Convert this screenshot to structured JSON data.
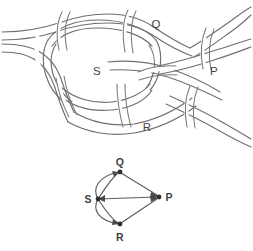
{
  "figure": {
    "background_color": "#ffffff",
    "stroke_color": "#6f6f72",
    "label_color": "#3f3f43",
    "node_color": "#2f2f33",
    "width": 253,
    "height": 251
  },
  "knot_diagram": {
    "name": "link-diagram",
    "description": "Hand drawn link diagram with four shaded regions labelled S, Q, P and R separated by crossing strands",
    "region_labels": [
      {
        "text": "S",
        "x": 97,
        "y": 71
      },
      {
        "text": "Q",
        "x": 156,
        "y": 24
      },
      {
        "text": "P",
        "x": 214,
        "y": 71
      },
      {
        "text": "R",
        "x": 147,
        "y": 127
      }
    ],
    "crossing_count": 6
  },
  "graph_diagram": {
    "name": "region-graph",
    "description": "Planar graph whose vertices are the labelled regions of the link diagram",
    "vertices": [
      {
        "id": "Q",
        "label": "Q",
        "x": 120,
        "y": 172,
        "label_x": 120,
        "label_y": 164
      },
      {
        "id": "S",
        "label": "S",
        "x": 98,
        "y": 199,
        "label_x": 88,
        "label_y": 202
      },
      {
        "id": "P",
        "label": "P",
        "x": 159,
        "y": 197,
        "label_x": 168,
        "label_y": 200
      },
      {
        "id": "R",
        "label": "R",
        "x": 120,
        "y": 224,
        "label_x": 120,
        "label_y": 240
      }
    ],
    "edges": [
      {
        "from": "S",
        "to": "Q",
        "style": "curve-left",
        "multiplicity": 1
      },
      {
        "from": "S",
        "to": "Q",
        "style": "curve-right",
        "multiplicity": 2
      },
      {
        "from": "S",
        "to": "R",
        "style": "curve-left",
        "multiplicity": 1
      },
      {
        "from": "S",
        "to": "R",
        "style": "curve-right",
        "multiplicity": 2
      },
      {
        "from": "S",
        "to": "P",
        "style": "straight",
        "multiplicity": 1
      },
      {
        "from": "Q",
        "to": "P",
        "style": "straight",
        "multiplicity": 1
      },
      {
        "from": "R",
        "to": "P",
        "style": "straight",
        "multiplicity": 1
      }
    ],
    "edge_count": 7,
    "vertex_count": 4
  }
}
